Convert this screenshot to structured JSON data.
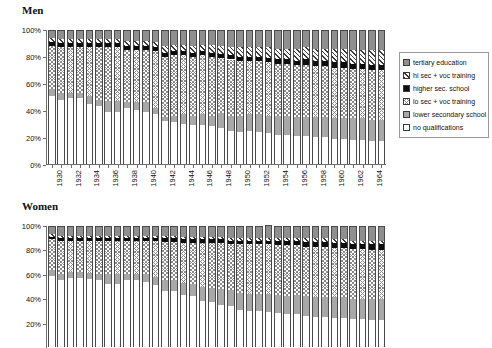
{
  "figure": {
    "panels": [
      {
        "id": "men",
        "title": "Men"
      },
      {
        "id": "women",
        "title": "Women"
      }
    ]
  },
  "legend": {
    "entries": [
      {
        "key": "tertiary",
        "label": "tertiary education",
        "pattern": "solid-dark-gray"
      },
      {
        "key": "hisecvoc",
        "label": "hi sec + voc training",
        "pattern": "diagonal-hatch"
      },
      {
        "key": "highsec",
        "label": "higher sec. school",
        "pattern": "solid-black"
      },
      {
        "key": "losecvoc",
        "label": "lo sec + voc training",
        "pattern": "cross-hatch-light"
      },
      {
        "key": "lowsec",
        "label": "lower secondary school",
        "pattern": "solid-mid-gray"
      },
      {
        "key": "none",
        "label": "no qualifications",
        "pattern": "solid-white"
      }
    ]
  },
  "chart_data": [
    {
      "id": "men",
      "type": "bar",
      "stacked": true,
      "percent": true,
      "title": "Men",
      "xlabel": "",
      "ylabel": "",
      "ylim": [
        0,
        100
      ],
      "yticks": [
        "0%",
        "20%",
        "40%",
        "60%",
        "80%",
        "100%"
      ],
      "ytick_values": [
        0,
        20,
        40,
        60,
        80,
        100
      ],
      "grid": false,
      "legend_position": "right",
      "categories": [
        1930,
        1931,
        1932,
        1933,
        1934,
        1935,
        1936,
        1937,
        1938,
        1939,
        1940,
        1941,
        1942,
        1943,
        1944,
        1945,
        1946,
        1947,
        1948,
        1949,
        1950,
        1951,
        1952,
        1953,
        1954,
        1955,
        1956,
        1957,
        1958,
        1959,
        1960,
        1961,
        1962,
        1963,
        1964,
        1965
      ],
      "xtick_labels": [
        "1930",
        "",
        "1932",
        "",
        "1934",
        "",
        "1936",
        "",
        "1938",
        "",
        "1940",
        "",
        "1942",
        "",
        "1944",
        "",
        "1946",
        "",
        "1948",
        "",
        "1950",
        "",
        "1952",
        "",
        "1954",
        "",
        "1956",
        "",
        "1958",
        "",
        "1960",
        "",
        "1962",
        "",
        "1964",
        ""
      ],
      "series": [
        {
          "name": "no qualifications",
          "key": "none",
          "values": [
            51,
            48,
            49,
            49,
            45,
            43,
            39,
            39,
            42,
            40,
            39,
            37,
            32,
            31,
            30,
            29,
            29,
            28,
            27,
            25,
            24,
            25,
            24,
            23,
            22,
            22,
            21,
            21,
            20,
            20,
            19,
            19,
            18,
            18,
            17,
            17
          ]
        },
        {
          "name": "lower secondary school",
          "key": "lowsec",
          "values": [
            5,
            5,
            4,
            4,
            6,
            5,
            8,
            8,
            4,
            6,
            7,
            5,
            3,
            5,
            7,
            7,
            8,
            8,
            11,
            11,
            12,
            12,
            13,
            13,
            14,
            14,
            14,
            14,
            15,
            15,
            15,
            15,
            16,
            16,
            16,
            16
          ]
        },
        {
          "name": "lo sec + voc training",
          "key": "losecvoc",
          "values": [
            32,
            34,
            34,
            34,
            36,
            39,
            40,
            40,
            39,
            39,
            39,
            42,
            45,
            45,
            44,
            44,
            44,
            44,
            41,
            42,
            41,
            40,
            40,
            40,
            39,
            39,
            39,
            39,
            38,
            38,
            38,
            38,
            37,
            37,
            37,
            37
          ]
        },
        {
          "name": "higher sec. school",
          "key": "highsec",
          "values": [
            3,
            3,
            3,
            3,
            3,
            3,
            3,
            3,
            3,
            3,
            3,
            3,
            3,
            3,
            3,
            3,
            3,
            3,
            3,
            3,
            3,
            3,
            3,
            3,
            3,
            3,
            3,
            4,
            4,
            4,
            4,
            4,
            4,
            4,
            4,
            4
          ]
        },
        {
          "name": "hi sec + voc training",
          "key": "hisecvoc",
          "values": [
            3,
            3,
            3,
            3,
            3,
            3,
            3,
            3,
            4,
            4,
            4,
            4,
            5,
            5,
            5,
            5,
            5,
            6,
            6,
            6,
            7,
            7,
            7,
            8,
            8,
            8,
            9,
            9,
            9,
            9,
            10,
            10,
            10,
            10,
            11,
            11
          ]
        },
        {
          "name": "tertiary education",
          "key": "tertiary",
          "values": [
            6,
            7,
            7,
            7,
            7,
            7,
            7,
            7,
            8,
            8,
            8,
            9,
            12,
            11,
            11,
            12,
            11,
            11,
            12,
            13,
            13,
            13,
            13,
            13,
            14,
            14,
            14,
            13,
            14,
            14,
            14,
            14,
            15,
            15,
            15,
            15
          ]
        }
      ]
    },
    {
      "id": "women",
      "type": "bar",
      "stacked": true,
      "percent": true,
      "title": "Women",
      "xlabel": "",
      "ylabel": "",
      "ylim": [
        0,
        100
      ],
      "yticks": [
        "20%",
        "40%",
        "60%",
        "80%",
        "100%"
      ],
      "ytick_values": [
        20,
        40,
        60,
        80,
        100
      ],
      "grid": false,
      "legend_position": "right",
      "note": "lower portion of panel is cropped by the image edge",
      "categories": [
        1930,
        1931,
        1932,
        1933,
        1934,
        1935,
        1936,
        1937,
        1938,
        1939,
        1940,
        1941,
        1942,
        1943,
        1944,
        1945,
        1946,
        1947,
        1948,
        1949,
        1950,
        1951,
        1952,
        1953,
        1954,
        1955,
        1956,
        1957,
        1958,
        1959,
        1960,
        1961,
        1962,
        1963,
        1964,
        1965
      ],
      "xtick_labels": [
        "1930",
        "",
        "1932",
        "",
        "1934",
        "",
        "1936",
        "",
        "1938",
        "",
        "1940",
        "",
        "1942",
        "",
        "1944",
        "",
        "1946",
        "",
        "1948",
        "",
        "1950",
        "",
        "1952",
        "",
        "1954",
        "",
        "1956",
        "",
        "1958",
        "",
        "1960",
        "",
        "1962",
        "",
        "1964",
        ""
      ],
      "series": [
        {
          "name": "no qualifications",
          "key": "none",
          "values": [
            59,
            55,
            57,
            57,
            56,
            55,
            52,
            52,
            55,
            55,
            54,
            51,
            46,
            46,
            43,
            42,
            38,
            37,
            35,
            34,
            31,
            30,
            30,
            29,
            28,
            27,
            27,
            26,
            25,
            25,
            24,
            24,
            23,
            23,
            22,
            22
          ]
        },
        {
          "name": "lower secondary school",
          "key": "lowsec",
          "values": [
            5,
            5,
            5,
            5,
            5,
            5,
            8,
            8,
            5,
            5,
            6,
            7,
            9,
            9,
            10,
            10,
            12,
            12,
            13,
            13,
            14,
            14,
            14,
            15,
            15,
            15,
            16,
            16,
            16,
            16,
            17,
            17,
            17,
            17,
            18,
            18
          ]
        },
        {
          "name": "lo sec + voc training",
          "key": "losecvoc",
          "values": [
            25,
            28,
            26,
            26,
            27,
            28,
            28,
            28,
            28,
            28,
            28,
            30,
            32,
            32,
            33,
            34,
            36,
            37,
            38,
            38,
            40,
            41,
            41,
            41,
            41,
            42,
            41,
            41,
            42,
            42,
            41,
            41,
            41,
            41,
            40,
            40
          ]
        },
        {
          "name": "higher sec. school",
          "key": "highsec",
          "values": [
            2,
            2,
            2,
            2,
            2,
            2,
            2,
            2,
            2,
            2,
            2,
            2,
            3,
            3,
            3,
            3,
            3,
            3,
            3,
            3,
            3,
            3,
            3,
            3,
            4,
            4,
            4,
            4,
            4,
            4,
            4,
            4,
            4,
            4,
            5,
            5
          ]
        },
        {
          "name": "hi sec + voc training",
          "key": "hisecvoc",
          "values": [
            2,
            2,
            2,
            2,
            2,
            2,
            2,
            2,
            2,
            2,
            2,
            2,
            2,
            2,
            2,
            2,
            2,
            2,
            2,
            2,
            2,
            2,
            2,
            2,
            2,
            2,
            2,
            3,
            3,
            3,
            3,
            3,
            3,
            3,
            3,
            3
          ]
        },
        {
          "name": "tertiary education",
          "key": "tertiary",
          "values": [
            7,
            8,
            8,
            8,
            8,
            8,
            8,
            8,
            8,
            8,
            8,
            8,
            8,
            8,
            9,
            9,
            9,
            9,
            9,
            10,
            10,
            10,
            10,
            11,
            10,
            10,
            10,
            10,
            10,
            10,
            11,
            11,
            12,
            12,
            12,
            12
          ]
        }
      ]
    }
  ]
}
